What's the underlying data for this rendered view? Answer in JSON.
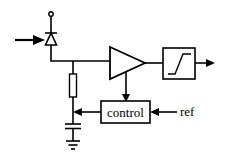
{
  "diagram": {
    "type": "circuit-block-diagram",
    "components": [
      {
        "id": "photodiode",
        "kind": "photodiode",
        "input": "light arrow"
      },
      {
        "id": "bias-terminal",
        "kind": "terminal-circle"
      },
      {
        "id": "resistor",
        "kind": "resistor"
      },
      {
        "id": "capacitor",
        "kind": "capacitor"
      },
      {
        "id": "ground",
        "kind": "ground"
      },
      {
        "id": "amplifier",
        "kind": "amplifier-triangle"
      },
      {
        "id": "comparator",
        "kind": "limiter-box",
        "symbol": "step/ramp"
      },
      {
        "id": "control",
        "kind": "block",
        "label": "control"
      }
    ],
    "labels": {
      "control": "control",
      "ref": "ref"
    },
    "colors": {
      "line": "#000000",
      "background": "#ffffff"
    }
  }
}
